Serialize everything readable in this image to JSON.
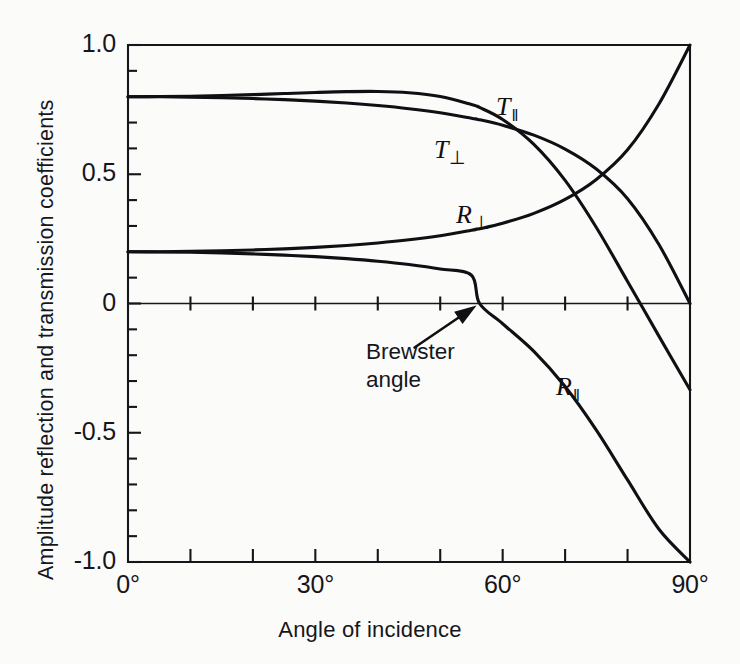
{
  "figure": {
    "background_color": "#fbfbfa",
    "ink_color": "#101014"
  },
  "axes": {
    "x_title": "Angle of incidence",
    "y_title": "Amplitude reflection and transmission coefficients",
    "x_tick_labels": [
      "0°",
      "30°",
      "60°",
      "90°"
    ],
    "y_tick_labels": [
      "1.0",
      "0.5",
      "0",
      "-0.5",
      "-1.0"
    ]
  },
  "annotation": {
    "text": "Brewster\nangle",
    "points_to_deg": 56.3,
    "points_to_value": 0
  },
  "curve_labels": [
    {
      "base": "T",
      "sub": "‖",
      "sub_kind": "par",
      "x": 496,
      "y": 92
    },
    {
      "base": "T",
      "sub": "⊥",
      "sub_kind": "perp",
      "x": 434,
      "y": 135
    },
    {
      "base": "R",
      "sub": "⊥",
      "sub_kind": "perp",
      "x": 456,
      "y": 200
    },
    {
      "base": "R",
      "sub": "‖",
      "sub_kind": "par",
      "x": 556,
      "y": 372
    }
  ],
  "chart_data": {
    "type": "line",
    "title": "",
    "xlabel": "Angle of incidence",
    "ylabel": "Amplitude reflection and transmission coefficients",
    "xlim": [
      0,
      90
    ],
    "ylim": [
      -1.0,
      1.0
    ],
    "grid": false,
    "legend": "inline-curve-labels",
    "x_ticks_major": [
      0,
      30,
      60,
      90
    ],
    "x_ticks_minor": [
      10,
      20,
      40,
      50,
      70,
      80
    ],
    "y_ticks_major": [
      1.0,
      0.5,
      0,
      -0.5,
      -1.0
    ],
    "y_ticks_minor": [
      0.9,
      0.8,
      0.7,
      0.6,
      0.4,
      0.3,
      0.2,
      0.1,
      -0.1,
      -0.2,
      -0.3,
      -0.4,
      -0.6,
      -0.7,
      -0.8,
      -0.9
    ],
    "refractive_index_ratio": 1.5,
    "brewster_angle_deg": 56.3,
    "x": [
      0,
      5,
      10,
      15,
      20,
      25,
      30,
      35,
      40,
      45,
      50,
      55,
      56.3,
      60,
      65,
      70,
      75,
      80,
      85,
      90
    ],
    "series": [
      {
        "name": "T_parallel",
        "label": "T‖",
        "values": [
          0.8,
          0.8005,
          0.802,
          0.8045,
          0.808,
          0.8121,
          0.8163,
          0.8196,
          0.8203,
          0.8155,
          0.8009,
          0.7698,
          0.7584,
          0.7118,
          0.6153,
          0.4761,
          0.2941,
          0.0852,
          -0.1252,
          -0.3333
        ]
      },
      {
        "name": "T_perpendicular",
        "label": "T⊥",
        "values": [
          0.8,
          0.7996,
          0.7983,
          0.7961,
          0.7929,
          0.7885,
          0.7828,
          0.7754,
          0.7658,
          0.7536,
          0.7377,
          0.7169,
          0.7109,
          0.6896,
          0.6513,
          0.5974,
          0.5201,
          0.4055,
          0.2292,
          0.0
        ]
      },
      {
        "name": "R_perpendicular",
        "label": "R⊥",
        "values": [
          0.2,
          0.2004,
          0.2017,
          0.2039,
          0.2071,
          0.2115,
          0.2172,
          0.2246,
          0.2342,
          0.2464,
          0.2623,
          0.2831,
          0.2891,
          0.3104,
          0.3487,
          0.4026,
          0.4799,
          0.5945,
          0.7708,
          1.0
        ]
      },
      {
        "name": "R_parallel",
        "label": "R‖",
        "values": [
          0.2,
          0.1995,
          0.198,
          0.1955,
          0.1919,
          0.1872,
          0.1812,
          0.1735,
          0.1636,
          0.1507,
          0.1334,
          0.1094,
          0.0,
          -0.0783,
          -0.1852,
          -0.3213,
          -0.4899,
          -0.6825,
          -0.8721,
          -1.0
        ]
      }
    ]
  }
}
